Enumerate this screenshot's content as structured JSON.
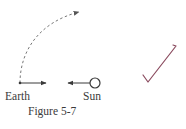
{
  "figure": {
    "caption": "Figure 5-7",
    "labels": {
      "earth": "Earth",
      "sun": "Sun"
    },
    "elements": {
      "orbit_path": "dashed curved arrow from Earth upward and to the right",
      "earth_velocity_arrow": "arrow pointing right from Earth",
      "sun_force_arrow": "arrow pointing left from Sun toward Earth",
      "sun_symbol": "circle"
    }
  },
  "annotation": {
    "mark": "checkmark",
    "color": "#8a4a5e"
  },
  "colors": {
    "ink": "#3a3a3a",
    "dashed_path": "#777777"
  }
}
